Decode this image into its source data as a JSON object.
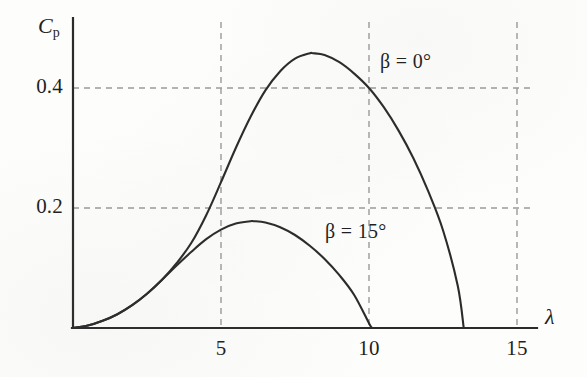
{
  "figure": {
    "background_color": "#fdfdfb",
    "ink_color": "#2b2b2b",
    "grid_color": "#9a9a9a"
  },
  "axes": {
    "y_title": "C",
    "y_title_subscript": "p",
    "x_title": "λ"
  },
  "ticks": {
    "y": [
      {
        "label": "0.4",
        "value": 0.4
      },
      {
        "label": "0.2",
        "value": 0.2
      }
    ],
    "x": [
      {
        "label": "5",
        "value": 5
      },
      {
        "label": "10",
        "value": 10
      },
      {
        "label": "15",
        "value": 15
      }
    ]
  },
  "annotations": [
    {
      "name": "beta-0-label",
      "text": "β = 0°",
      "x": 380,
      "y": 50
    },
    {
      "name": "beta-15-label",
      "text": "β = 15°",
      "x": 325,
      "y": 220
    }
  ],
  "chart_data": {
    "type": "line",
    "title": "",
    "subtitle": "",
    "xlabel": "λ",
    "ylabel": "Cp",
    "xlim": [
      0,
      16.0
    ],
    "ylim": [
      0,
      0.52
    ],
    "grid": "dashed gridlines at x = 5, 10, 15 and y = 0.2, 0.4",
    "legend": "inline labels next to each curve",
    "x_tick_values": [
      5,
      10,
      15
    ],
    "y_tick_values": [
      0.2,
      0.4
    ],
    "series": [
      {
        "name": "β = 0°",
        "peak_x": 8.1,
        "peak_y": 0.458,
        "zero_crossing_x": 13.2,
        "x": [
          0.0,
          0.5,
          1.0,
          1.5,
          2.0,
          2.5,
          3.0,
          3.5,
          4.0,
          4.5,
          5.0,
          5.5,
          6.0,
          6.5,
          7.0,
          7.5,
          8.0,
          8.1,
          8.5,
          9.0,
          9.5,
          10.0,
          10.5,
          11.0,
          11.5,
          12.0,
          12.5,
          13.0,
          13.2
        ],
        "values": [
          0.0,
          0.004,
          0.012,
          0.023,
          0.038,
          0.057,
          0.08,
          0.108,
          0.142,
          0.188,
          0.243,
          0.3,
          0.352,
          0.396,
          0.428,
          0.449,
          0.458,
          0.458,
          0.455,
          0.443,
          0.424,
          0.4,
          0.368,
          0.329,
          0.283,
          0.228,
          0.163,
          0.07,
          0.0
        ]
      },
      {
        "name": "β = 15°",
        "peak_x": 6.1,
        "peak_y": 0.178,
        "zero_crossing_x": 10.1,
        "x": [
          0.0,
          0.5,
          1.0,
          1.5,
          2.0,
          2.5,
          3.0,
          3.5,
          4.0,
          4.5,
          5.0,
          5.5,
          6.0,
          6.1,
          6.5,
          7.0,
          7.5,
          8.0,
          8.5,
          9.0,
          9.5,
          10.0,
          10.1
        ],
        "values": [
          0.0,
          0.004,
          0.012,
          0.023,
          0.038,
          0.057,
          0.08,
          0.104,
          0.127,
          0.148,
          0.164,
          0.174,
          0.178,
          0.178,
          0.176,
          0.168,
          0.155,
          0.137,
          0.115,
          0.088,
          0.055,
          0.008,
          0.0
        ]
      }
    ]
  },
  "geometry": {
    "origin_px": [
      73,
      328
    ],
    "x_px_per_unit": 29.6,
    "y_px_per_unit": 600,
    "axis_x_end_px": 537,
    "axis_y_top_px": 18
  }
}
